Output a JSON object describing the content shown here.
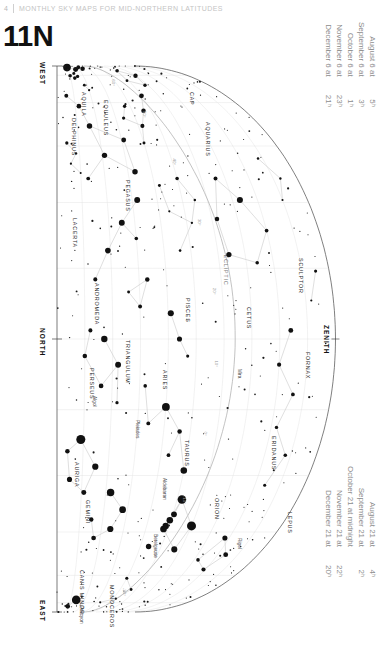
{
  "running_header": {
    "page_number": "4",
    "title": "Monthly Sky Maps for Mid-Northern Latitudes"
  },
  "plate": {
    "number": "11N"
  },
  "chart_data": {
    "type": "scatter",
    "title": "11N",
    "projection": "half-dome horizon sky map, rotated 90 degrees",
    "orientation_note": "Map is printed sideways; west at top-left, east at bottom-left, zenith at right.",
    "grid": true,
    "horizon_labels": [
      "WEST",
      "NORTH",
      "EAST"
    ],
    "zenith_label": "ZENITH",
    "ecliptic_label": "ECLIPTIC",
    "declination_ticks": [
      "60°",
      "50°",
      "40°",
      "30°",
      "20°",
      "10°",
      "0°",
      "-10°",
      "-20°",
      "-30°"
    ],
    "dates_top": [
      {
        "when": "August 6 at",
        "hour": "5ʰ"
      },
      {
        "when": "September 6 at",
        "hour": "3ʰ"
      },
      {
        "when": "October 6 at",
        "hour": "1ʰ"
      },
      {
        "when": "November 6 at",
        "hour": "23ʰ"
      },
      {
        "when": "December 6 at",
        "hour": "21ʰ"
      }
    ],
    "dates_bottom": [
      {
        "when": "August 21 at",
        "hour": "4ʰ"
      },
      {
        "when": "September 21 at",
        "hour": "2ʰ"
      },
      {
        "when": "October 21 at midnight",
        "hour": ""
      },
      {
        "when": "November 21 at",
        "hour": "22ʰ"
      },
      {
        "when": "December 21 at",
        "hour": "20ʰ"
      }
    ],
    "constellations": [
      {
        "name": "AQUILA",
        "x": 82,
        "y": 92
      },
      {
        "name": "DELPHINUS",
        "x": 72,
        "y": 118
      },
      {
        "name": "EQUULEUS",
        "x": 104,
        "y": 100
      },
      {
        "name": "CAP",
        "x": 190,
        "y": 92
      },
      {
        "name": "AQUARIUS",
        "x": 206,
        "y": 122
      },
      {
        "name": "PEGASUS",
        "x": 126,
        "y": 180
      },
      {
        "name": "LACERTA",
        "x": 73,
        "y": 218
      },
      {
        "name": "SCULPTOR",
        "x": 299,
        "y": 258
      },
      {
        "name": "ANDROMEDA",
        "x": 95,
        "y": 283
      },
      {
        "name": "PISCES",
        "x": 186,
        "y": 298
      },
      {
        "name": "CETUS",
        "x": 247,
        "y": 307
      },
      {
        "name": "TRIANGULUM",
        "x": 126,
        "y": 340
      },
      {
        "name": "PERSEUS",
        "x": 90,
        "y": 368
      },
      {
        "name": "ARIES",
        "x": 163,
        "y": 370
      },
      {
        "name": "FORNAX",
        "x": 306,
        "y": 352
      },
      {
        "name": "TAURUS",
        "x": 185,
        "y": 440
      },
      {
        "name": "ERIDANUS",
        "x": 272,
        "y": 436
      },
      {
        "name": "AURIGA",
        "x": 75,
        "y": 462
      },
      {
        "name": "GEMINI",
        "x": 86,
        "y": 500
      },
      {
        "name": "ORION",
        "x": 215,
        "y": 498
      },
      {
        "name": "LEPUS",
        "x": 288,
        "y": 512
      },
      {
        "name": "CANIS MINOR",
        "x": 80,
        "y": 570
      },
      {
        "name": "MONOCEROS",
        "x": 110,
        "y": 585
      }
    ],
    "named_stars": [
      {
        "name": "Algol",
        "x": 93,
        "y": 396
      },
      {
        "name": "Pleiades",
        "x": 136,
        "y": 420
      },
      {
        "name": "Mira",
        "x": 238,
        "y": 369
      },
      {
        "name": "Aldebaran",
        "x": 163,
        "y": 478
      },
      {
        "name": "Betelgeuse",
        "x": 154,
        "y": 534
      },
      {
        "name": "Rigel",
        "x": 238,
        "y": 538
      },
      {
        "name": "Procyon",
        "x": 80,
        "y": 606
      }
    ],
    "magnitude_scale": {
      "brightest_px": 8,
      "faintest_px": 1.2,
      "note": "Dot area proportional to star brightness; 0th-magnitude stars largest."
    }
  }
}
